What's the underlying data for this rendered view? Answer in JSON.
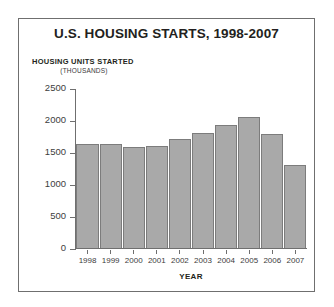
{
  "chart_data": {
    "type": "bar",
    "title": "U.S. HOUSING STARTS, 1998-2007",
    "xlabel": "YEAR",
    "ylabel": "HOUSING UNITS STARTED",
    "ylabel_sub": "(THOUSANDS)",
    "categories": [
      "1998",
      "1999",
      "2000",
      "2001",
      "2002",
      "2003",
      "2004",
      "2005",
      "2006",
      "2007"
    ],
    "values": [
      1625,
      1625,
      1575,
      1600,
      1700,
      1800,
      1925,
      2050,
      1775,
      1300
    ],
    "ylim": [
      0,
      2500
    ],
    "yticks": [
      0,
      500,
      1000,
      1500,
      2000,
      2500
    ],
    "ytick_labels": [
      "0",
      "500",
      "1000",
      "1500",
      "2000",
      "2500"
    ],
    "grid": false,
    "legend": "none",
    "series": [
      {
        "name": "Housing units started",
        "values": [
          1625,
          1625,
          1575,
          1600,
          1700,
          1800,
          1925,
          2050,
          1775,
          1300
        ]
      }
    ],
    "colors": {
      "bar_fill": "#a9a9a9",
      "bar_border": "#7c7c7c",
      "axis": "#6f6f6f",
      "text": "#231f20",
      "frame": "#6f6f6f"
    }
  },
  "page": {
    "top_partial_text": ""
  }
}
